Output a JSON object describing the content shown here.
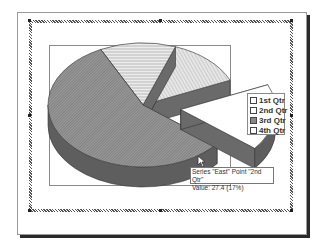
{
  "chart_data": {
    "type": "pie",
    "style": "3d-exploded",
    "categories": [
      "1st Qtr",
      "2nd Qtr",
      "3rd Qtr",
      "4th Qtr"
    ],
    "series": [
      {
        "name": "East",
        "values": [
          20.4,
          27.4,
          90,
          20.4
        ]
      }
    ],
    "exploded_point": "2nd Qtr",
    "legend": [
      "1st Qtr",
      "2nd Qtr",
      "3rd Qtr",
      "4th Qtr"
    ],
    "legend_position": "right",
    "title": ""
  },
  "tooltip": {
    "line1": "Series \"East\" Point \"2nd Qtr\"",
    "line2": "Value: 27.4 (17%)"
  },
  "colors": {
    "shadow": "#2a2a2a",
    "slice_dark": "#7d7d7d",
    "slice_side": "#5e5e5e",
    "slice_light": "#d8d8d8",
    "border": "#8a8a8a"
  }
}
